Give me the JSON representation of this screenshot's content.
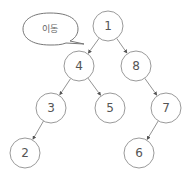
{
  "callout": {
    "text": "이동",
    "x": 50,
    "y": 29
  },
  "nodes": [
    {
      "id": "1",
      "label": "1",
      "x": 108,
      "y": 26
    },
    {
      "id": "4",
      "label": "4",
      "x": 79,
      "y": 66
    },
    {
      "id": "8",
      "label": "8",
      "x": 136,
      "y": 66
    },
    {
      "id": "3",
      "label": "3",
      "x": 51,
      "y": 108
    },
    {
      "id": "5",
      "label": "5",
      "x": 110,
      "y": 108
    },
    {
      "id": "7",
      "label": "7",
      "x": 166,
      "y": 108
    },
    {
      "id": "2",
      "label": "2",
      "x": 25,
      "y": 153
    },
    {
      "id": "6",
      "label": "6",
      "x": 139,
      "y": 153
    }
  ],
  "edges": [
    {
      "from": "1",
      "to": "4"
    },
    {
      "from": "1",
      "to": "8"
    },
    {
      "from": "4",
      "to": "3"
    },
    {
      "from": "4",
      "to": "5"
    },
    {
      "from": "8",
      "to": "7"
    },
    {
      "from": "3",
      "to": "2"
    },
    {
      "from": "7",
      "to": "6"
    }
  ],
  "style": {
    "node_radius": 15,
    "stroke": "#9a9a9a"
  }
}
